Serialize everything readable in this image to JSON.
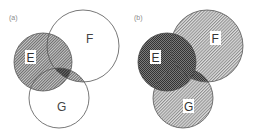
{
  "figure": {
    "panels": [
      {
        "id": "a",
        "label": "(a)",
        "sets": [
          {
            "name": "E",
            "label": "E",
            "shading": "hatched",
            "label_boxed": true
          },
          {
            "name": "F",
            "label": "F",
            "shading": "none",
            "label_boxed": false
          },
          {
            "name": "G",
            "label": "G",
            "shading": "none",
            "label_boxed": false
          }
        ],
        "highlighted_regions": [
          "E",
          "E∩F∩G (dark)",
          "(F∩G) outside E (hatched)"
        ],
        "description": "Shaded region E ∪ (F ∩ G)"
      },
      {
        "id": "b",
        "label": "(b)",
        "sets": [
          {
            "name": "E",
            "label": "E",
            "shading": "dark",
            "label_boxed": true
          },
          {
            "name": "F",
            "label": "F",
            "shading": "hatched",
            "label_boxed": true
          },
          {
            "name": "G",
            "label": "G",
            "shading": "hatched",
            "label_boxed": true
          }
        ],
        "highlighted_regions": [
          "E (dark)",
          "F∩G (dark)",
          "F",
          "G"
        ],
        "description": "Shaded region (E ∪ F) ∩ (E ∪ G) overlaid on F and G"
      }
    ]
  },
  "colors": {
    "outline": "#555555",
    "hatch_light": "#9a9a9a",
    "hatch_dark": "#4a4a4a",
    "background": "#ffffff"
  }
}
